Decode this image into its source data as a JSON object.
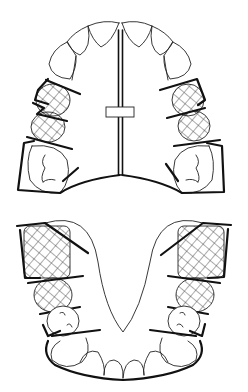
{
  "diagram": {
    "title": "",
    "colors": {
      "background": "#ffffff",
      "line": "#111111",
      "hatch": "#444444"
    },
    "upper_arch": {
      "label": "",
      "components": [
        "incisors",
        "canines",
        "hatched premolars",
        "molars",
        "midline expansion screw",
        "acrylic plate",
        "clasps"
      ]
    },
    "lower_arch": {
      "label": "",
      "components": [
        "incisors",
        "canines",
        "hatched premolars and molars",
        "lingual plate outline",
        "clasps"
      ]
    }
  }
}
